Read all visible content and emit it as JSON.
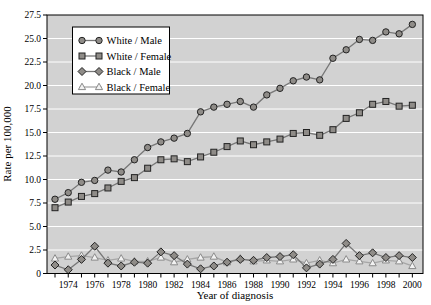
{
  "figure": {
    "xlabel": "Year of diagnosis",
    "ylabel": "Rate per 100,000"
  },
  "colors": {
    "panel_bg": "#d2d2d2",
    "gridline": "#ffffff",
    "frame": "#000000",
    "series_line": "#777777",
    "marker_fill": "#8f8c88",
    "marker_stroke": "#222222",
    "open_series_line": "#a6a6a6",
    "open_marker_fill": "#f2f2f2",
    "open_marker_stroke": "#8a8a8a",
    "legend_bg": "#ffffff",
    "legend_border": "#000000"
  },
  "chart_data": {
    "type": "line",
    "title": "",
    "xlabel": "Year of diagnosis",
    "ylabel": "Rate per 100,000",
    "x": [
      1973,
      1974,
      1975,
      1976,
      1977,
      1978,
      1979,
      1980,
      1981,
      1982,
      1983,
      1984,
      1985,
      1986,
      1987,
      1988,
      1989,
      1990,
      1991,
      1992,
      1993,
      1994,
      1995,
      1996,
      1997,
      1998,
      1999,
      2000
    ],
    "x_tick_labels": [
      "1974",
      "1976",
      "1978",
      "1980",
      "1982",
      "1984",
      "1986",
      "1988",
      "1990",
      "1992",
      "1994",
      "1996",
      "1998",
      "2000"
    ],
    "y_ticks": [
      0,
      2.5,
      5.0,
      7.5,
      10.0,
      12.5,
      15.0,
      17.5,
      20.0,
      22.5,
      25.0,
      27.5
    ],
    "y_tick_labels": [
      "0",
      "2.5",
      "5.0",
      "7.5",
      "10.0",
      "12.5",
      "15.0",
      "17.5",
      "20.0",
      "22.5",
      "25.0",
      "27.5"
    ],
    "ylim": [
      0,
      27.5
    ],
    "grid": "horizontal-white-on-gray",
    "legend_position": "upper-left",
    "series": [
      {
        "name": "White / Male",
        "marker": "circle",
        "values": [
          7.9,
          8.6,
          9.7,
          9.9,
          11.0,
          10.8,
          12.1,
          13.4,
          14.0,
          14.4,
          14.9,
          17.2,
          17.7,
          18.0,
          18.3,
          17.7,
          19.0,
          19.7,
          20.5,
          20.9,
          20.6,
          22.9,
          23.8,
          24.9,
          24.8,
          25.7,
          25.5,
          26.5
        ]
      },
      {
        "name": "White / Female",
        "marker": "square",
        "values": [
          7.0,
          7.6,
          8.2,
          8.5,
          9.1,
          9.8,
          10.2,
          11.2,
          12.1,
          12.2,
          11.9,
          12.4,
          12.9,
          13.5,
          14.1,
          13.7,
          14.0,
          14.3,
          14.9,
          15.0,
          14.7,
          15.3,
          16.5,
          17.1,
          18.0,
          18.3,
          17.8,
          17.9
        ]
      },
      {
        "name": "Black / Male",
        "marker": "diamond",
        "values": [
          0.9,
          0.4,
          1.5,
          2.9,
          1.1,
          0.8,
          1.2,
          1.1,
          2.3,
          1.9,
          1.0,
          0.5,
          0.8,
          1.2,
          1.5,
          1.4,
          1.7,
          1.8,
          2.0,
          0.6,
          1.0,
          1.5,
          3.2,
          1.9,
          2.2,
          1.7,
          1.9,
          1.7
        ]
      },
      {
        "name": "Black / Female",
        "marker": "triangle-open",
        "values": [
          1.6,
          1.8,
          1.9,
          1.7,
          1.4,
          1.6,
          1.3,
          1.3,
          1.7,
          1.2,
          1.5,
          1.7,
          1.8,
          1.2,
          1.6,
          1.3,
          1.4,
          1.3,
          1.5,
          1.1,
          1.4,
          1.1,
          1.5,
          1.3,
          1.1,
          1.4,
          1.3,
          0.8
        ]
      }
    ]
  }
}
